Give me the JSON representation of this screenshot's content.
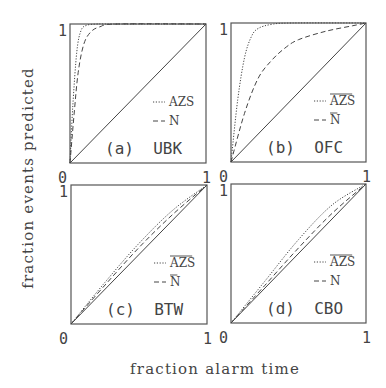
{
  "chart_data": {
    "type": "line",
    "xlabel": "fraction alarm time",
    "ylabel": "fraction events predicted",
    "panels": [
      {
        "id": "a",
        "title": "(a) UBK",
        "xlim": [
          0,
          1
        ],
        "ylim": [
          0,
          1
        ],
        "xticks": [
          "0",
          "1"
        ],
        "yticks": [
          "0",
          "1"
        ],
        "legend": [
          {
            "style": "dotted",
            "label": "AZS",
            "overline": false
          },
          {
            "style": "dashed",
            "label": "N",
            "overline": false
          }
        ],
        "series": [
          {
            "name": "reference",
            "style": "solid",
            "x": [
              0,
              1
            ],
            "y": [
              0,
              1
            ]
          },
          {
            "name": "AZS",
            "style": "dotted",
            "x": [
              0,
              0.02,
              0.05,
              0.08,
              0.12,
              0.2,
              0.3,
              1
            ],
            "y": [
              0,
              0.4,
              0.8,
              0.95,
              0.99,
              1.0,
              1.0,
              1.0
            ]
          },
          {
            "name": "N",
            "style": "dashed",
            "x": [
              0,
              0.03,
              0.06,
              0.1,
              0.15,
              0.22,
              0.35,
              1
            ],
            "y": [
              0,
              0.35,
              0.65,
              0.85,
              0.94,
              0.98,
              1.0,
              1.0
            ]
          }
        ]
      },
      {
        "id": "b",
        "title": "(b) OFC",
        "xlim": [
          0,
          1
        ],
        "ylim": [
          0,
          1
        ],
        "xticks": [
          "0",
          "1"
        ],
        "yticks": [
          "0",
          "1"
        ],
        "legend": [
          {
            "style": "dotted",
            "label": "AZS",
            "overline": true
          },
          {
            "style": "dashed",
            "label": "N",
            "overline": true
          }
        ],
        "series": [
          {
            "name": "reference",
            "style": "solid",
            "x": [
              0,
              1
            ],
            "y": [
              0,
              1
            ]
          },
          {
            "name": "AZS",
            "style": "dotted",
            "x": [
              0,
              0.05,
              0.1,
              0.15,
              0.2,
              0.3,
              0.45,
              1
            ],
            "y": [
              0,
              0.45,
              0.75,
              0.9,
              0.96,
              0.99,
              1.0,
              1.0
            ]
          },
          {
            "name": "N",
            "style": "dashed",
            "x": [
              0,
              0.1,
              0.2,
              0.3,
              0.4,
              0.5,
              0.7,
              0.9,
              1
            ],
            "y": [
              0,
              0.35,
              0.6,
              0.73,
              0.82,
              0.88,
              0.94,
              0.98,
              1.0
            ]
          }
        ]
      },
      {
        "id": "c",
        "title": "(c) BTW",
        "xlim": [
          0,
          1
        ],
        "ylim": [
          0,
          1
        ],
        "xticks": [
          "0",
          "1"
        ],
        "yticks": [
          "0",
          "1"
        ],
        "legend": [
          {
            "style": "dotted",
            "label": "AZS",
            "overline": true
          },
          {
            "style": "dashed",
            "label": "N",
            "overline": true
          }
        ],
        "series": [
          {
            "name": "reference",
            "style": "solid",
            "x": [
              0,
              1
            ],
            "y": [
              0,
              1
            ]
          },
          {
            "name": "AZS",
            "style": "dotted",
            "x": [
              0,
              0.25,
              0.5,
              0.75,
              1
            ],
            "y": [
              0,
              0.3,
              0.58,
              0.82,
              1.0
            ]
          },
          {
            "name": "N",
            "style": "dashed",
            "x": [
              0,
              0.25,
              0.5,
              0.75,
              1
            ],
            "y": [
              0,
              0.28,
              0.55,
              0.79,
              1.0
            ]
          }
        ]
      },
      {
        "id": "d",
        "title": "(d) CBO",
        "xlim": [
          0,
          1
        ],
        "ylim": [
          0,
          1
        ],
        "xticks": [
          "0",
          "1"
        ],
        "yticks": [
          "0",
          "1"
        ],
        "legend": [
          {
            "style": "dotted",
            "label": "AZS",
            "overline": true
          },
          {
            "style": "dashed",
            "label": "N",
            "overline": false
          }
        ],
        "series": [
          {
            "name": "reference",
            "style": "solid",
            "x": [
              0,
              1
            ],
            "y": [
              0,
              1
            ]
          },
          {
            "name": "AZS",
            "style": "dotted",
            "x": [
              0,
              0.25,
              0.5,
              0.75,
              1
            ],
            "y": [
              0,
              0.3,
              0.6,
              0.85,
              1.0
            ]
          },
          {
            "name": "N",
            "style": "dashed",
            "x": [
              0,
              0.25,
              0.5,
              0.75,
              1
            ],
            "y": [
              0,
              0.27,
              0.54,
              0.79,
              1.0
            ]
          }
        ]
      }
    ],
    "grid": false,
    "layout": "2x2"
  },
  "labels": {
    "xlabel": "fraction alarm time",
    "ylabel": "fraction events predicted"
  }
}
